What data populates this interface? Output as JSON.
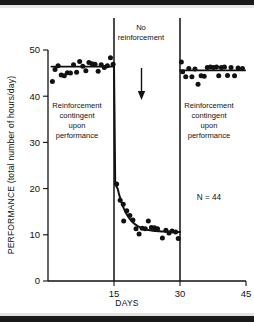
{
  "figure": {
    "title": "",
    "n_label": "N = 44",
    "top_label": "No\nreinforcement",
    "top_label_line1": "No",
    "top_label_line2": "reinforcement",
    "arrow_icon": "down-arrow-icon",
    "left_annotation": {
      "line1": "Reinforcement",
      "line2": "contingent",
      "line3": "upon",
      "line4": "performance"
    },
    "right_annotation": {
      "line1": "Reinforcement",
      "line2": "contingent",
      "line3": "upon",
      "line4": "performance"
    }
  },
  "chart_data": {
    "type": "scatter",
    "title": "",
    "subtitle": "",
    "xlabel": "DAYS",
    "ylabel": "PERFORMANCE (total number of hours/day)",
    "xlim": [
      0,
      45
    ],
    "ylim": [
      0,
      50
    ],
    "xticks": [
      15,
      30,
      45
    ],
    "xtick_labels": [
      "15",
      "30",
      "45"
    ],
    "yticks": [
      0,
      10,
      20,
      30,
      40,
      50
    ],
    "ytick_labels": [
      "0",
      "10",
      "20",
      "30",
      "40",
      "50"
    ],
    "grid": false,
    "legend": null,
    "annotations": [
      {
        "name": "no-reinforcement-label",
        "text": "No reinforcement",
        "x": 22.5,
        "y": 53
      },
      {
        "name": "left-phase-label",
        "text": "Reinforcement contingent upon performance",
        "x": 7.5,
        "y": 36
      },
      {
        "name": "right-phase-label",
        "text": "Reinforcement contingent upon performance",
        "x": 37.5,
        "y": 36
      },
      {
        "name": "sample-size-label",
        "text": "N = 44",
        "x": 37,
        "y": 20
      },
      {
        "name": "down-arrow",
        "text": "",
        "x": 22.5,
        "y": 42
      }
    ],
    "phase_dividers": [
      15,
      30
    ],
    "series": [
      {
        "name": "Baseline (reinforcement contingent)",
        "phase": "baseline",
        "points": [
          {
            "x": 1.0,
            "y": 43.2
          },
          {
            "x": 1.6,
            "y": 45.8
          },
          {
            "x": 2.3,
            "y": 46.6
          },
          {
            "x": 3.0,
            "y": 44.6
          },
          {
            "x": 3.7,
            "y": 44.4
          },
          {
            "x": 4.4,
            "y": 45.1
          },
          {
            "x": 5.1,
            "y": 45.0
          },
          {
            "x": 5.8,
            "y": 46.8
          },
          {
            "x": 6.5,
            "y": 45.2
          },
          {
            "x": 7.2,
            "y": 47.5
          },
          {
            "x": 7.9,
            "y": 46.5
          },
          {
            "x": 8.6,
            "y": 45.5
          },
          {
            "x": 9.3,
            "y": 47.3
          },
          {
            "x": 10.0,
            "y": 47.0
          },
          {
            "x": 10.7,
            "y": 46.9
          },
          {
            "x": 11.4,
            "y": 45.4
          },
          {
            "x": 12.1,
            "y": 46.8
          },
          {
            "x": 12.8,
            "y": 46.2
          },
          {
            "x": 13.5,
            "y": 46.6
          },
          {
            "x": 14.2,
            "y": 48.3
          },
          {
            "x": 14.8,
            "y": 46.9
          }
        ]
      },
      {
        "name": "Extinction (no reinforcement)",
        "phase": "extinction",
        "points": [
          {
            "x": 15.6,
            "y": 21.0
          },
          {
            "x": 16.4,
            "y": 17.5
          },
          {
            "x": 17.1,
            "y": 16.6
          },
          {
            "x": 17.2,
            "y": 13.0
          },
          {
            "x": 17.9,
            "y": 15.2
          },
          {
            "x": 18.6,
            "y": 14.2
          },
          {
            "x": 19.3,
            "y": 13.2
          },
          {
            "x": 20.0,
            "y": 11.3
          },
          {
            "x": 20.7,
            "y": 10.2
          },
          {
            "x": 21.4,
            "y": 11.4
          },
          {
            "x": 22.1,
            "y": 11.3
          },
          {
            "x": 22.8,
            "y": 13.0
          },
          {
            "x": 23.5,
            "y": 11.6
          },
          {
            "x": 24.2,
            "y": 11.5
          },
          {
            "x": 24.9,
            "y": 11.3
          },
          {
            "x": 26.0,
            "y": 9.3
          },
          {
            "x": 26.8,
            "y": 11.0
          },
          {
            "x": 27.5,
            "y": 10.4
          },
          {
            "x": 28.2,
            "y": 10.8
          },
          {
            "x": 29.0,
            "y": 10.6
          },
          {
            "x": 29.6,
            "y": 9.2
          }
        ]
      },
      {
        "name": "Reconditioning (reinforcement contingent)",
        "phase": "recovery",
        "points": [
          {
            "x": 30.3,
            "y": 47.4
          },
          {
            "x": 30.6,
            "y": 45.3
          },
          {
            "x": 31.3,
            "y": 44.2
          },
          {
            "x": 32.0,
            "y": 46.0
          },
          {
            "x": 32.7,
            "y": 44.2
          },
          {
            "x": 33.4,
            "y": 45.9
          },
          {
            "x": 34.1,
            "y": 42.6
          },
          {
            "x": 34.8,
            "y": 44.4
          },
          {
            "x": 35.5,
            "y": 44.3
          },
          {
            "x": 36.2,
            "y": 46.2
          },
          {
            "x": 36.9,
            "y": 46.3
          },
          {
            "x": 37.6,
            "y": 46.2
          },
          {
            "x": 38.3,
            "y": 46.3
          },
          {
            "x": 38.8,
            "y": 44.4
          },
          {
            "x": 39.4,
            "y": 46.2
          },
          {
            "x": 40.1,
            "y": 46.3
          },
          {
            "x": 40.8,
            "y": 44.5
          },
          {
            "x": 41.6,
            "y": 46.2
          },
          {
            "x": 42.4,
            "y": 44.4
          },
          {
            "x": 43.2,
            "y": 46.1
          },
          {
            "x": 44.2,
            "y": 46.0
          }
        ]
      }
    ],
    "fit_lines": [
      {
        "name": "baseline-trend",
        "type": "flat",
        "x0": 0.8,
        "x1": 15.0,
        "y": 46.4
      },
      {
        "name": "recovery-trend",
        "type": "flat",
        "x0": 30.0,
        "x1": 44.8,
        "y": 45.6
      },
      {
        "name": "extinction-decay",
        "type": "curve",
        "x0": 15.0,
        "x1": 30.0,
        "y_start": 46.4,
        "y_drop": 21.0,
        "y_asymptote": 10.6
      }
    ]
  }
}
